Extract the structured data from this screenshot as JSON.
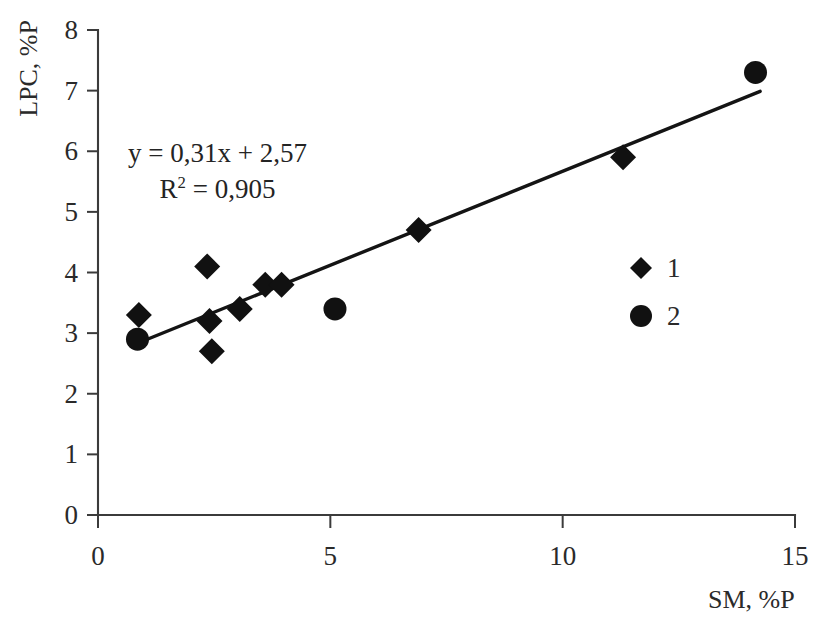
{
  "chart_data": {
    "type": "scatter",
    "title": "",
    "subtitle": "",
    "xlabel": "SM, %P",
    "ylabel": "LPC, %P",
    "xlim": [
      0,
      15
    ],
    "ylim": [
      0,
      8
    ],
    "xticks": [
      "0",
      "5",
      "10",
      "15"
    ],
    "xtick_values": [
      0,
      5,
      10,
      15
    ],
    "yticks": [
      "0",
      "1",
      "2",
      "3",
      "4",
      "5",
      "6",
      "7",
      "8"
    ],
    "ytick_values": [
      0,
      1,
      2,
      3,
      4,
      5,
      6,
      7,
      8
    ],
    "grid": false,
    "legend_position": "right-inside",
    "annotations": {
      "equation": "y = 0,31x + 2,57",
      "r_squared_prefix": "R",
      "r_squared_exponent": "2",
      "r_squared_value": " = 0,905"
    },
    "series": [
      {
        "name": "1",
        "marker": "diamond",
        "color": "#111111",
        "points": [
          {
            "x": 0.88,
            "y": 3.3
          },
          {
            "x": 2.35,
            "y": 4.1
          },
          {
            "x": 2.4,
            "y": 3.2
          },
          {
            "x": 2.45,
            "y": 2.7
          },
          {
            "x": 3.05,
            "y": 3.4
          },
          {
            "x": 3.6,
            "y": 3.8
          },
          {
            "x": 3.95,
            "y": 3.8
          },
          {
            "x": 6.9,
            "y": 4.7
          },
          {
            "x": 11.3,
            "y": 5.9
          }
        ]
      },
      {
        "name": "2",
        "marker": "circle",
        "color": "#111111",
        "points": [
          {
            "x": 0.85,
            "y": 2.9
          },
          {
            "x": 5.1,
            "y": 3.4
          },
          {
            "x": 14.15,
            "y": 7.3
          }
        ]
      }
    ],
    "trendline": {
      "slope": 0.31,
      "intercept": 2.57,
      "r_squared": 0.905,
      "x_start": 0.85,
      "x_end": 14.25,
      "color": "#141414"
    }
  },
  "legend": {
    "items": [
      {
        "label": "1",
        "marker": "diamond"
      },
      {
        "label": "2",
        "marker": "circle"
      }
    ]
  },
  "axes": {
    "y_title": "LPC, %P",
    "x_title": "SM, %P"
  }
}
